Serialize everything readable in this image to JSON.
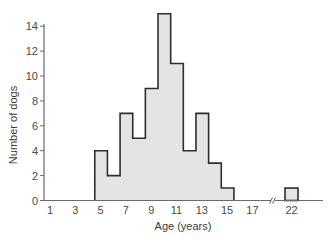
{
  "chart_data": {
    "type": "bar",
    "subtype": "histogram",
    "title": "",
    "xlabel": "Age (years)",
    "ylabel": "Number of dogs",
    "x": [
      5,
      6,
      7,
      8,
      9,
      10,
      11,
      12,
      13,
      14,
      15,
      22
    ],
    "values": [
      4,
      2,
      7,
      5,
      9,
      15,
      11,
      4,
      7,
      3,
      1,
      1
    ],
    "x_tick_labels": [
      "1",
      "3",
      "5",
      "7",
      "9",
      "11",
      "13",
      "15",
      "17",
      "22"
    ],
    "y_tick_labels": [
      "0",
      "2",
      "4",
      "6",
      "8",
      "10",
      "12",
      "14"
    ],
    "ylim": [
      0,
      14
    ],
    "axis_break_between": [
      17,
      22
    ],
    "grid": false,
    "legend": null,
    "colors": {
      "bar_fill": "#e4e4e4",
      "bar_edge": "#2e2e2e",
      "axis": "#6a6a6a"
    }
  }
}
